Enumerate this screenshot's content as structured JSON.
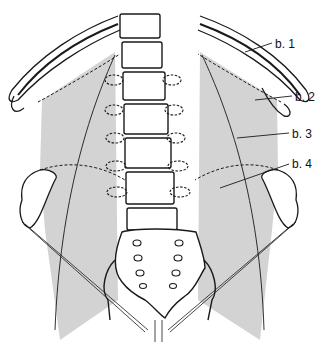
{
  "figure": {
    "labels": [
      {
        "id": "b1",
        "text": "b. 1",
        "x": 275,
        "y": 44
      },
      {
        "id": "b2",
        "text": "b. 2",
        "x": 295,
        "y": 97
      },
      {
        "id": "b3",
        "text": "b. 3",
        "x": 292,
        "y": 134
      },
      {
        "id": "b4",
        "text": "b. 4",
        "x": 292,
        "y": 164
      }
    ],
    "colors": {
      "muscle_fill": "#d2d2d2",
      "line": "#1a1a1a",
      "background": "#ffffff"
    }
  }
}
